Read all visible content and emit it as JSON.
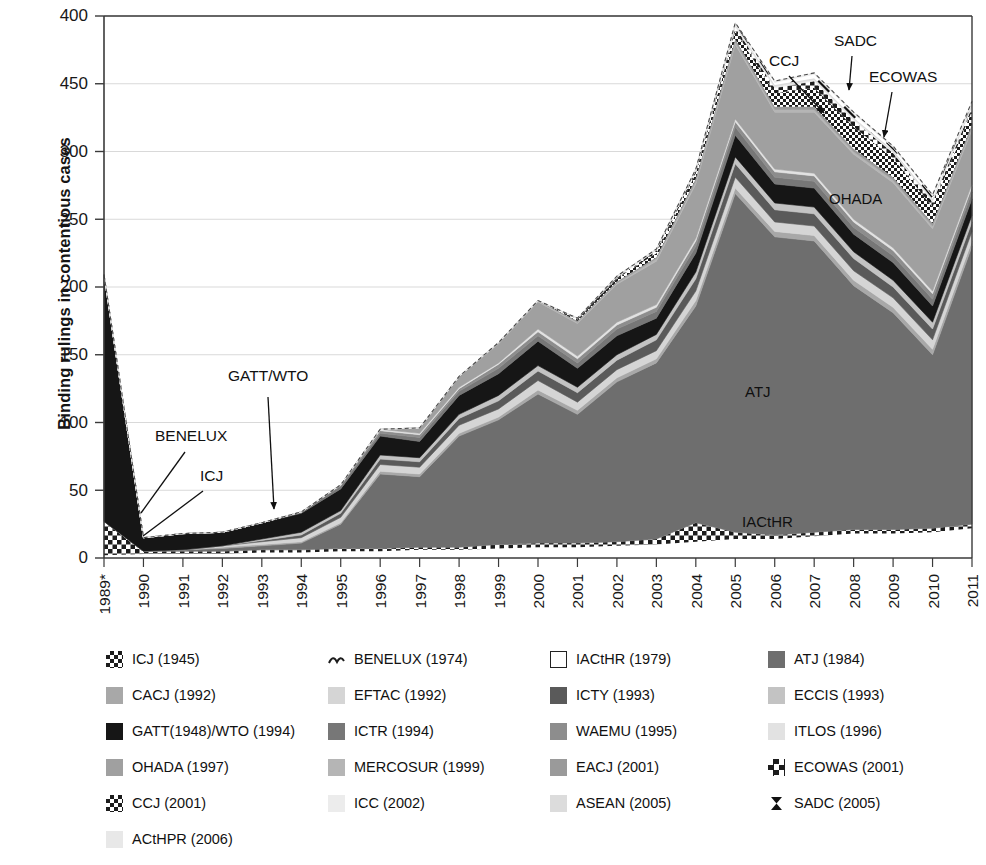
{
  "axis": {
    "y_title": "Binding rulings in contentious cases",
    "y_tick_labels": [
      "400",
      "450",
      "300",
      "250",
      "200",
      "150",
      "100",
      "50",
      "0"
    ],
    "x_tick_labels": [
      "1989*",
      "1990",
      "1991",
      "1992",
      "1993",
      "1994",
      "1995",
      "1996",
      "1997",
      "1998",
      "1999",
      "2000",
      "2001",
      "2002",
      "2003",
      "2004",
      "2005",
      "2006",
      "2007",
      "2008",
      "2009",
      "2010",
      "2011"
    ]
  },
  "annotations": [
    {
      "name": "gatt-wto",
      "text": "GATT/WTO",
      "x": 228,
      "y": 381,
      "arrow": true,
      "ax": 268,
      "ay": 397,
      "bx": 274,
      "by": 509
    },
    {
      "name": "benelux",
      "text": "BENELUX",
      "x": 155,
      "y": 441,
      "arrow": false,
      "ax": 185,
      "ay": 452,
      "bx": 141,
      "by": 513
    },
    {
      "name": "icj",
      "text": "ICJ",
      "x": 200,
      "y": 481,
      "arrow": false,
      "ax": 203,
      "ay": 491,
      "bx": 143,
      "by": 536
    },
    {
      "name": "ccj",
      "text": "CCJ",
      "x": 769,
      "y": 66,
      "arrow": true,
      "ax": 789,
      "ay": 76,
      "bx": 824,
      "by": 113
    },
    {
      "name": "sadc",
      "text": "SADC",
      "x": 834,
      "y": 46,
      "arrow": true,
      "ax": 852,
      "ay": 56,
      "bx": 849,
      "by": 90
    },
    {
      "name": "ecowas",
      "text": "ECOWAS",
      "x": 869,
      "y": 82,
      "arrow": true,
      "ax": 892,
      "ay": 92,
      "bx": 884,
      "by": 137
    }
  ],
  "inside_labels": [
    {
      "name": "ohada",
      "text": "OHADA",
      "x": 829,
      "y": 204
    },
    {
      "name": "atj",
      "text": "ATJ",
      "x": 745,
      "y": 397
    },
    {
      "name": "iacthr",
      "text": "IACtHR",
      "x": 742,
      "y": 527
    }
  ],
  "legend": [
    {
      "label": "ICJ (1945)",
      "pattern": "check-bold",
      "color": "#1c1c1c"
    },
    {
      "label": "BENELUX (1974)",
      "pattern": "wave",
      "color": "#1c1c1c"
    },
    {
      "label": "IACtHR (1979)",
      "pattern": "solid",
      "color": "#ffffff"
    },
    {
      "label": "ATJ (1984)",
      "pattern": "solid",
      "color": "#6e6e6e"
    },
    {
      "label": "CACJ (1992)",
      "pattern": "solid",
      "color": "#a8a8a8"
    },
    {
      "label": "EFTAC (1992)",
      "pattern": "solid",
      "color": "#d5d5d5"
    },
    {
      "label": "ICTY (1993)",
      "pattern": "solid",
      "color": "#5a5a5a"
    },
    {
      "label": "ECCIS (1993)",
      "pattern": "solid",
      "color": "#c3c3c3"
    },
    {
      "label": "GATT(1948)/WTO (1994)",
      "pattern": "solid",
      "color": "#161616"
    },
    {
      "label": "ICTR (1994)",
      "pattern": "solid",
      "color": "#777777"
    },
    {
      "label": "WAEMU (1995)",
      "pattern": "solid",
      "color": "#8d8d8d"
    },
    {
      "label": "ITLOS (1996)",
      "pattern": "solid",
      "color": "#e2e2e2"
    },
    {
      "label": "OHADA (1997)",
      "pattern": "solid",
      "color": "#a0a0a0"
    },
    {
      "label": "MERCOSUR (1999)",
      "pattern": "solid",
      "color": "#b5b5b5"
    },
    {
      "label": "EACJ (2001)",
      "pattern": "solid",
      "color": "#9a9a9a"
    },
    {
      "label": "ECOWAS (2001)",
      "pattern": "check-small",
      "color": "#1c1c1c"
    },
    {
      "label": "CCJ (2001)",
      "pattern": "check-bold",
      "color": "#1c1c1c"
    },
    {
      "label": "ICC (2002)",
      "pattern": "solid",
      "color": "#ececec"
    },
    {
      "label": "ASEAN (2005)",
      "pattern": "solid",
      "color": "#dcdcdc"
    },
    {
      "label": "SADC (2005)",
      "pattern": "hourglass",
      "color": "#111111"
    },
    {
      "label": "ACtHPR (2006)",
      "pattern": "solid",
      "color": "#e8e8e8"
    }
  ],
  "chart_data": {
    "type": "area",
    "title": "",
    "xlabel": "",
    "ylabel": "Binding rulings in contentious cases",
    "ylim": [
      0,
      400
    ],
    "ytick_values": [
      400,
      350,
      300,
      250,
      200,
      150,
      100,
      50,
      0
    ],
    "grid": true,
    "legend_position": "bottom",
    "stacked": true,
    "x": [
      1989,
      1990,
      1991,
      1992,
      1993,
      1994,
      1995,
      1996,
      1997,
      1998,
      1999,
      2000,
      2001,
      2002,
      2003,
      2004,
      2005,
      2006,
      2007,
      2008,
      2009,
      2010,
      2011
    ],
    "x_labels": [
      "1989*",
      "1990",
      "1991",
      "1992",
      "1993",
      "1994",
      "1995",
      "1996",
      "1997",
      "1998",
      "1999",
      "2000",
      "2001",
      "2002",
      "2003",
      "2004",
      "2005",
      "2006",
      "2007",
      "2008",
      "2009",
      "2010",
      "2011"
    ],
    "series": [
      {
        "name": "IACtHR (1979)",
        "color": "#ffffff",
        "pattern": "solid",
        "values": [
          2,
          3,
          3,
          3,
          4,
          4,
          5,
          5,
          6,
          6,
          7,
          8,
          8,
          9,
          10,
          12,
          14,
          14,
          16,
          18,
          18,
          19,
          22
        ]
      },
      {
        "name": "ICJ (1945)",
        "color": "#1c1c1c",
        "pattern": "check-bold",
        "values": [
          25,
          2,
          2,
          2,
          2,
          2,
          2,
          2,
          2,
          2,
          3,
          3,
          3,
          3,
          4,
          14,
          5,
          3,
          3,
          3,
          3,
          3,
          3
        ]
      },
      {
        "name": "ATJ (1984)",
        "color": "#6e6e6e",
        "pattern": "solid",
        "values": [
          0,
          0,
          1,
          2,
          3,
          5,
          18,
          55,
          52,
          82,
          92,
          110,
          95,
          118,
          130,
          160,
          250,
          220,
          215,
          180,
          160,
          128,
          205
        ]
      },
      {
        "name": "CACJ (1992)",
        "color": "#a8a8a8",
        "pattern": "solid",
        "values": [
          0,
          0,
          0,
          1,
          1,
          1,
          1,
          2,
          2,
          2,
          2,
          3,
          3,
          3,
          3,
          4,
          4,
          4,
          4,
          4,
          4,
          4,
          4
        ]
      },
      {
        "name": "EFTAC (1992)",
        "color": "#d5d5d5",
        "pattern": "solid",
        "values": [
          0,
          0,
          0,
          1,
          2,
          3,
          4,
          5,
          5,
          6,
          6,
          7,
          6,
          6,
          6,
          7,
          8,
          7,
          7,
          7,
          7,
          7,
          7
        ]
      },
      {
        "name": "ICTY (1993)",
        "color": "#5a5a5a",
        "pattern": "solid",
        "values": [
          0,
          0,
          0,
          0,
          1,
          2,
          3,
          4,
          4,
          5,
          6,
          7,
          7,
          7,
          8,
          9,
          10,
          9,
          9,
          9,
          8,
          8,
          7
        ]
      },
      {
        "name": "ECCIS (1993)",
        "color": "#c3c3c3",
        "pattern": "solid",
        "values": [
          0,
          0,
          0,
          0,
          1,
          2,
          2,
          3,
          3,
          3,
          4,
          4,
          4,
          4,
          4,
          5,
          5,
          5,
          5,
          5,
          5,
          5,
          5
        ]
      },
      {
        "name": "GATT(1948)/WTO (1994)",
        "color": "#161616",
        "pattern": "solid",
        "values": [
          182,
          10,
          12,
          10,
          12,
          14,
          16,
          14,
          12,
          14,
          16,
          18,
          14,
          14,
          12,
          14,
          16,
          14,
          14,
          13,
          13,
          12,
          12
        ]
      },
      {
        "name": "ICTR (1994)",
        "color": "#777777",
        "pattern": "solid",
        "values": [
          0,
          0,
          0,
          0,
          0,
          1,
          2,
          2,
          3,
          3,
          4,
          4,
          4,
          5,
          5,
          5,
          6,
          5,
          5,
          5,
          5,
          5,
          5
        ]
      },
      {
        "name": "WAEMU (1995)",
        "color": "#8d8d8d",
        "pattern": "solid",
        "values": [
          0,
          0,
          0,
          0,
          0,
          0,
          1,
          2,
          2,
          2,
          3,
          3,
          3,
          3,
          3,
          4,
          4,
          4,
          4,
          4,
          4,
          4,
          4
        ]
      },
      {
        "name": "ITLOS (1996)",
        "color": "#e2e2e2",
        "pattern": "solid",
        "values": [
          0,
          0,
          0,
          0,
          0,
          0,
          0,
          1,
          1,
          1,
          1,
          2,
          2,
          2,
          2,
          2,
          2,
          2,
          2,
          2,
          2,
          2,
          2
        ]
      },
      {
        "name": "OHADA (1997)",
        "color": "#a0a0a0",
        "pattern": "solid",
        "values": [
          0,
          0,
          0,
          0,
          0,
          0,
          0,
          0,
          4,
          8,
          14,
          20,
          24,
          28,
          32,
          40,
          55,
          42,
          45,
          48,
          48,
          46,
          40
        ]
      },
      {
        "name": "MERCOSUR (1999)",
        "color": "#b5b5b5",
        "pattern": "solid",
        "values": [
          0,
          0,
          0,
          0,
          0,
          0,
          0,
          0,
          0,
          0,
          1,
          1,
          1,
          1,
          2,
          2,
          2,
          2,
          2,
          2,
          2,
          2,
          2
        ]
      },
      {
        "name": "EACJ (2001)",
        "color": "#9a9a9a",
        "pattern": "solid",
        "values": [
          0,
          0,
          0,
          0,
          0,
          0,
          0,
          0,
          0,
          0,
          0,
          0,
          1,
          1,
          1,
          2,
          2,
          2,
          2,
          2,
          2,
          2,
          2
        ]
      },
      {
        "name": "ECOWAS (2001)",
        "color": "#1c1c1c",
        "pattern": "check-small",
        "values": [
          0,
          0,
          0,
          0,
          0,
          0,
          0,
          0,
          0,
          0,
          0,
          0,
          1,
          2,
          3,
          4,
          6,
          10,
          14,
          16,
          14,
          12,
          10
        ]
      },
      {
        "name": "CCJ (2001)",
        "color": "#1c1c1c",
        "pattern": "check-bold",
        "values": [
          0,
          0,
          0,
          0,
          0,
          0,
          0,
          0,
          0,
          0,
          0,
          0,
          1,
          1,
          2,
          2,
          3,
          4,
          5,
          5,
          4,
          4,
          3
        ]
      },
      {
        "name": "ICC (2002)",
        "color": "#ececec",
        "pattern": "solid",
        "values": [
          0,
          0,
          0,
          0,
          0,
          0,
          0,
          0,
          0,
          0,
          0,
          0,
          0,
          1,
          1,
          1,
          1,
          1,
          1,
          1,
          1,
          1,
          1
        ]
      },
      {
        "name": "ASEAN (2005)",
        "color": "#dcdcdc",
        "pattern": "solid",
        "values": [
          0,
          0,
          0,
          0,
          0,
          0,
          0,
          0,
          0,
          0,
          0,
          0,
          0,
          0,
          0,
          0,
          1,
          1,
          1,
          1,
          1,
          1,
          1
        ]
      },
      {
        "name": "SADC (2005)",
        "color": "#111111",
        "pattern": "hourglass",
        "values": [
          0,
          0,
          0,
          0,
          0,
          0,
          0,
          0,
          0,
          0,
          0,
          0,
          0,
          0,
          0,
          0,
          1,
          2,
          3,
          3,
          2,
          2,
          1
        ]
      },
      {
        "name": "ACtHPR (2006)",
        "color": "#e8e8e8",
        "pattern": "solid",
        "values": [
          0,
          0,
          0,
          0,
          0,
          0,
          0,
          0,
          0,
          0,
          0,
          0,
          0,
          0,
          0,
          0,
          0,
          1,
          1,
          1,
          1,
          1,
          1
        ]
      }
    ],
    "totals": [
      209,
      15,
      18,
      19,
      26,
      34,
      54,
      95,
      96,
      134,
      159,
      190,
      177,
      208,
      228,
      287,
      395,
      352,
      358,
      329,
      304,
      268,
      337
    ]
  }
}
